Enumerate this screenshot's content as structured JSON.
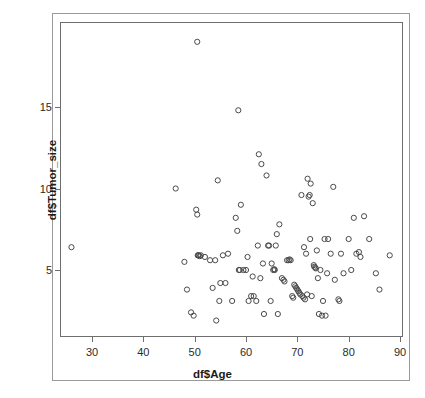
{
  "figure": {
    "background_color": "#ffffff",
    "border_color": "#9a9a9a",
    "plot_border_color": "#6e6e6e",
    "point_color": "#4a4a4a"
  },
  "axes": {
    "x_title": "df$Age",
    "y_title": "df$Tumor_size",
    "x_ticks": [
      "30",
      "40",
      "50",
      "60",
      "70",
      "80",
      "90"
    ],
    "x_tick_values": [
      30,
      40,
      50,
      60,
      70,
      80,
      90
    ],
    "y_ticks": [
      "5",
      "10",
      "15"
    ],
    "y_tick_values": [
      5,
      10,
      15
    ]
  },
  "chart_data": {
    "type": "scatter",
    "title": "",
    "xlabel": "df$Age",
    "ylabel": "df$Tumor_size",
    "xlim": [
      24,
      90
    ],
    "ylim": [
      1.6,
      19.6
    ],
    "grid": false,
    "legend": "none",
    "marker": "open-circle",
    "n_points": 120,
    "x": [
      26.0,
      46.3,
      48.0,
      48.5,
      49.3,
      49.8,
      50.3,
      50.5,
      50.5,
      50.6,
      50.7,
      50.8,
      51.0,
      51.2,
      52.0,
      53.0,
      53.5,
      54.0,
      54.2,
      54.5,
      54.8,
      55.0,
      55.5,
      56.0,
      56.5,
      57.3,
      58.0,
      58.3,
      58.5,
      58.6,
      58.8,
      59.0,
      59.5,
      60.0,
      60.3,
      60.5,
      61.0,
      61.3,
      61.5,
      62.0,
      62.3,
      62.5,
      62.8,
      63.0,
      63.3,
      63.5,
      64.0,
      64.3,
      64.5,
      64.8,
      65.0,
      65.3,
      65.5,
      65.6,
      65.8,
      66.0,
      66.2,
      66.5,
      67.0,
      67.3,
      67.5,
      68.0,
      68.3,
      68.5,
      68.7,
      69.0,
      69.2,
      69.4,
      69.6,
      69.8,
      70.0,
      70.2,
      70.4,
      70.6,
      70.8,
      71.0,
      71.2,
      71.3,
      71.5,
      71.7,
      71.9,
      72.0,
      72.2,
      72.4,
      72.5,
      72.6,
      72.8,
      73.0,
      73.2,
      73.3,
      73.5,
      73.6,
      73.8,
      74.0,
      74.2,
      74.5,
      74.8,
      75.0,
      75.3,
      75.5,
      75.8,
      76.0,
      76.5,
      77.0,
      77.3,
      78.0,
      78.2,
      78.5,
      79.0,
      80.0,
      80.5,
      81.0,
      81.5,
      82.0,
      82.3,
      83.0,
      84.0,
      85.3,
      86.0,
      88.0
    ],
    "y": [
      6.4,
      10.0,
      5.5,
      3.8,
      2.4,
      2.2,
      8.7,
      8.4,
      19.0,
      5.9,
      5.9,
      5.9,
      5.85,
      5.9,
      5.8,
      5.6,
      3.9,
      5.6,
      1.9,
      10.5,
      3.1,
      4.2,
      5.9,
      4.2,
      6.0,
      3.1,
      8.2,
      7.4,
      14.8,
      5.0,
      5.0,
      9.0,
      5.0,
      5.0,
      5.8,
      3.1,
      3.4,
      4.6,
      3.4,
      3.1,
      6.5,
      12.1,
      4.5,
      11.5,
      5.4,
      2.3,
      10.8,
      6.5,
      6.5,
      3.1,
      5.4,
      5.0,
      5.05,
      5.0,
      6.5,
      7.2,
      2.3,
      7.8,
      4.5,
      4.4,
      4.3,
      5.6,
      5.6,
      5.65,
      5.6,
      3.4,
      3.3,
      4.1,
      4.0,
      3.9,
      3.8,
      3.7,
      3.6,
      3.5,
      9.6,
      3.4,
      3.3,
      6.4,
      3.2,
      6.0,
      3.5,
      10.6,
      9.5,
      9.6,
      6.9,
      10.3,
      3.4,
      9.1,
      5.3,
      5.2,
      5.15,
      5.1,
      6.2,
      4.5,
      2.3,
      5.0,
      2.2,
      3.1,
      6.9,
      2.2,
      4.8,
      6.9,
      6.0,
      10.1,
      4.4,
      3.2,
      3.1,
      6.0,
      4.8,
      6.9,
      5.0,
      8.2,
      6.0,
      6.1,
      5.8,
      8.3,
      6.9,
      4.8,
      3.8,
      5.9
    ]
  }
}
